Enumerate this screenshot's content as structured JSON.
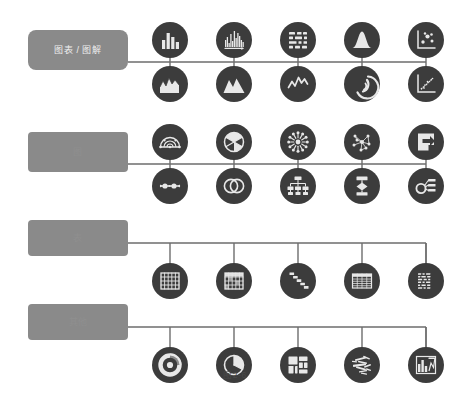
{
  "figure": {
    "caption": "图2-6",
    "background_color": "#ffffff",
    "category_box_color": "#8a8a8a",
    "node_circle_color": "#3c3c3c",
    "connector_color": "#6d6d6d",
    "icon_color": "#e8e8e8"
  },
  "categories": [
    {
      "id": "charts-diagrams",
      "label": "图表 / 图解",
      "label_style": "strong",
      "box": {
        "x": 28,
        "y": 30,
        "width": 100,
        "height": 40,
        "radius": 8
      },
      "spine_y": 62,
      "row_style": "two-row"
    },
    {
      "id": "graphs",
      "label": "图",
      "label_style": "faint",
      "box": {
        "x": 28,
        "y": 132,
        "width": 100,
        "height": 40,
        "radius": 4
      },
      "spine_y": 164,
      "row_style": "two-row"
    },
    {
      "id": "tables",
      "label": "表",
      "label_style": "faint",
      "box": {
        "x": 28,
        "y": 220,
        "width": 100,
        "height": 36,
        "radius": 4
      },
      "spine_y": 243,
      "row_style": "one-row"
    },
    {
      "id": "others",
      "label": "其他",
      "label_style": "faint",
      "box": {
        "x": 28,
        "y": 304,
        "width": 100,
        "height": 36,
        "radius": 4
      },
      "spine_y": 327,
      "row_style": "one-row"
    }
  ],
  "layout": {
    "column_centers": [
      170,
      234,
      298,
      362,
      426
    ],
    "circle_radius": 18,
    "spine_start_x": 128,
    "spine_end_x": 426,
    "row_offsets": {
      "top": -22,
      "bottom": 22,
      "single": 21
    }
  },
  "nodes": {
    "charts-diagrams": {
      "top": [
        {
          "icon": "bar-chart-icon",
          "label": "柱状图"
        },
        {
          "icon": "histogram-icon",
          "label": "直方图"
        },
        {
          "icon": "gantt-chart-icon",
          "label": "甘特图"
        },
        {
          "icon": "bell-curve-icon",
          "label": "正态分布图"
        },
        {
          "icon": "scatter-plot-icon",
          "label": "散点图"
        }
      ],
      "bottom": [
        {
          "icon": "area-chart-icon",
          "label": "面积图"
        },
        {
          "icon": "mountain-area-icon",
          "label": "山形面积图"
        },
        {
          "icon": "line-chart-icon",
          "label": "折线图"
        },
        {
          "icon": "arc-gauge-icon",
          "label": "弧形图"
        },
        {
          "icon": "trend-scatter-icon",
          "label": "趋势散点图"
        }
      ]
    },
    "graphs": {
      "top": [
        {
          "icon": "chord-arc-icon",
          "label": "弦图"
        },
        {
          "icon": "radial-pie-icon",
          "label": "放射饼图"
        },
        {
          "icon": "radial-burst-icon",
          "label": "放射图"
        },
        {
          "icon": "network-graph-icon",
          "label": "网络图"
        },
        {
          "icon": "pointer-arrow-icon",
          "label": "指示图"
        }
      ],
      "bottom": [
        {
          "icon": "timeline-icon",
          "label": "时间轴"
        },
        {
          "icon": "venn-diagram-icon",
          "label": "维恩图"
        },
        {
          "icon": "org-chart-icon",
          "label": "组织结构图"
        },
        {
          "icon": "flowchart-icon",
          "label": "流程图"
        },
        {
          "icon": "concept-map-icon",
          "label": "概念图"
        }
      ]
    },
    "tables": {
      "single": [
        {
          "icon": "grid-table-icon",
          "label": "网格表"
        },
        {
          "icon": "highlight-table-icon",
          "label": "高亮表"
        },
        {
          "icon": "staircase-table-icon",
          "label": "阶梯表"
        },
        {
          "icon": "spreadsheet-icon",
          "label": "电子表格"
        },
        {
          "icon": "data-matrix-icon",
          "label": "数据矩阵"
        }
      ]
    },
    "others": {
      "single": [
        {
          "icon": "donut-chart-icon",
          "label": "环形图"
        },
        {
          "icon": "pie-chart-icon",
          "label": "饼图"
        },
        {
          "icon": "treemap-icon",
          "label": "矩形树图"
        },
        {
          "icon": "word-cloud-icon",
          "label": "词云"
        },
        {
          "icon": "infographic-icon",
          "label": "信息图"
        }
      ]
    }
  }
}
